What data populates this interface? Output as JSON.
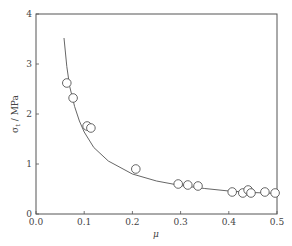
{
  "chart_data": {
    "type": "scatter",
    "title": "",
    "xlabel": "μ",
    "ylabel": "σ_t / MPa",
    "ylabel_main": "σ",
    "ylabel_sub": "t",
    "ylabel_unit": " / MPa",
    "xlim": [
      0.0,
      0.5
    ],
    "ylim": [
      0,
      4
    ],
    "x_ticks": [
      "0.0",
      "0.1",
      "0.2",
      "0.3",
      "0.4",
      "0.5"
    ],
    "y_ticks": [
      "0",
      "1",
      "2",
      "3",
      "4"
    ],
    "grid": false,
    "legend": null,
    "series": [
      {
        "name": "measured",
        "marker": "open-circle",
        "x": [
          0.064,
          0.077,
          0.106,
          0.114,
          0.207,
          0.295,
          0.315,
          0.336,
          0.407,
          0.429,
          0.44,
          0.446,
          0.475,
          0.496
        ],
        "y": [
          2.62,
          2.32,
          1.76,
          1.72,
          0.9,
          0.6,
          0.58,
          0.56,
          0.44,
          0.42,
          0.48,
          0.42,
          0.44,
          0.42
        ]
      },
      {
        "name": "fit",
        "style": "line",
        "x": [
          0.058,
          0.064,
          0.07,
          0.08,
          0.09,
          0.1,
          0.12,
          0.15,
          0.2,
          0.25,
          0.3,
          0.35,
          0.4,
          0.45,
          0.5
        ],
        "y": [
          3.52,
          2.95,
          2.55,
          2.15,
          1.86,
          1.64,
          1.33,
          1.06,
          0.8,
          0.66,
          0.57,
          0.51,
          0.46,
          0.43,
          0.41
        ]
      }
    ]
  }
}
